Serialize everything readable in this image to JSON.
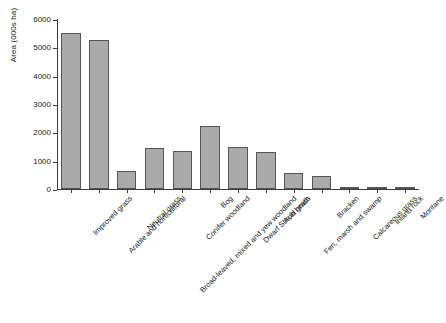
{
  "chart_data": {
    "type": "bar",
    "title": "",
    "subtitle": "",
    "xlabel": "",
    "ylabel": "Area (000s ha)",
    "ylim": [
      0,
      6000
    ],
    "yticks": [
      0,
      1000,
      2000,
      3000,
      4000,
      5000,
      6000
    ],
    "ytick_labels": [
      "0",
      "1000",
      "2000",
      "3000",
      "4000",
      "5000",
      "6000"
    ],
    "grid": false,
    "legend": null,
    "bar_color": "#aaaaaa",
    "bar_edge_color": "#555555",
    "axis_color": "#3c3c3c",
    "categories": [
      "Improved grass",
      "Arable and horticultural",
      "Neutral grass",
      "Broad-leaved, mixed and yew woodland",
      "Conifer woodland",
      "Bog",
      "Dwarf Shrub heath",
      "Acid grass",
      "Fen, marsh and swamp",
      "Bracken",
      "Calcareous grass",
      "Inland rock",
      "Montane"
    ],
    "values": [
      5500,
      5250,
      620,
      1450,
      1350,
      2220,
      1480,
      1290,
      580,
      450,
      80,
      60,
      40
    ]
  }
}
